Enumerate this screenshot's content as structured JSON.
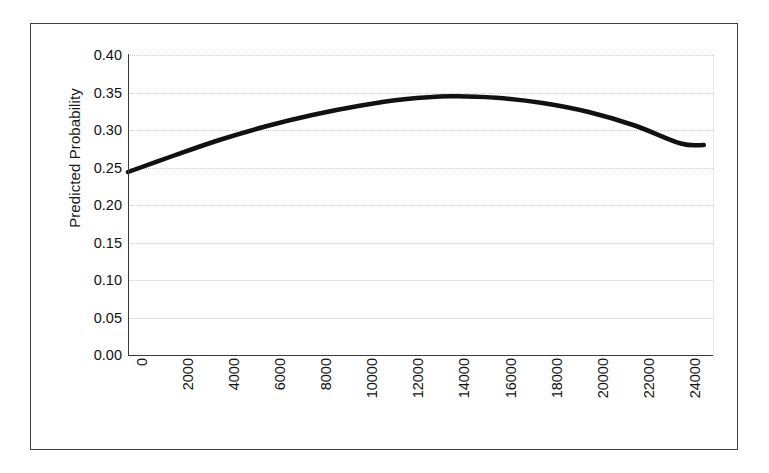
{
  "chart_data": {
    "type": "line",
    "title": "",
    "xlabel": "",
    "ylabel": "Predicted Probability",
    "x": [
      0,
      2000,
      4000,
      6000,
      8000,
      10000,
      12000,
      14000,
      16000,
      18000,
      20000,
      22000,
      24000,
      25000
    ],
    "values": [
      0.244,
      0.266,
      0.287,
      0.305,
      0.32,
      0.332,
      0.341,
      0.345,
      0.343,
      0.336,
      0.324,
      0.306,
      0.282,
      0.28
    ],
    "series": [
      {
        "name": "Predicted Probability",
        "values": [
          0.244,
          0.266,
          0.287,
          0.305,
          0.32,
          0.332,
          0.341,
          0.345,
          0.343,
          0.336,
          0.324,
          0.306,
          0.282,
          0.28
        ]
      }
    ],
    "xlim": [
      0,
      25400
    ],
    "ylim": [
      0.0,
      0.4
    ],
    "ytick_labels": [
      "0.40",
      "0.35",
      "0.30",
      "0.25",
      "0.20",
      "0.15",
      "0.10",
      "0.05",
      "0.00"
    ],
    "ytick_values": [
      0.4,
      0.35,
      0.3,
      0.25,
      0.2,
      0.15,
      0.1,
      0.05,
      0.0
    ],
    "xtick_labels": [
      "0",
      "2000",
      "4000",
      "6000",
      "8000",
      "10000",
      "12000",
      "14000",
      "16000",
      "18000",
      "20000",
      "22000",
      "24000"
    ],
    "xtick_values": [
      0,
      2000,
      4000,
      6000,
      8000,
      10000,
      12000,
      14000,
      16000,
      18000,
      20000,
      22000,
      24000
    ],
    "grid": "horizontal",
    "legend": "none",
    "line_color": "#111111",
    "line_width": 4.5,
    "frame_color": "#3c3c3c",
    "gridline_color": "#c9c9c9",
    "background": "#ffffff",
    "xtick_label_rotation": -90
  }
}
